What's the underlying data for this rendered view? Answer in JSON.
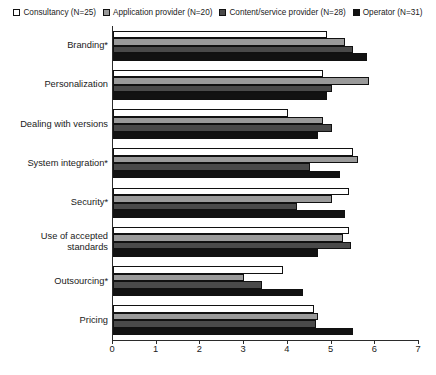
{
  "legend": {
    "entries": [
      {
        "label": "Consultancy (N=25)",
        "color": "#ffffff",
        "swatch": "legend-swatch-consultancy"
      },
      {
        "label": "Application provider (N=20)",
        "color": "#9a9a9a",
        "swatch": "legend-swatch-application-provider"
      },
      {
        "label": "Content/service provider (N=28)",
        "color": "#4a4a4a",
        "swatch": "legend-swatch-content-service-provider"
      },
      {
        "label": "Operator (N=31)",
        "color": "#121212",
        "swatch": "legend-swatch-operator"
      }
    ]
  },
  "axis": {
    "x_ticks": [
      "0",
      "1",
      "2",
      "3",
      "4",
      "5",
      "6",
      "7"
    ]
  },
  "chart_data": {
    "type": "bar",
    "orientation": "horizontal",
    "title": "",
    "subtitle": "",
    "xlabel": "",
    "ylabel": "",
    "xlim": [
      0,
      7
    ],
    "grid": false,
    "legend_position": "top",
    "categories": [
      "Branding*",
      "Personalization",
      "Dealing with versions",
      "System integration*",
      "Security*",
      "Use of accepted standards",
      "Outsourcing*",
      "Pricing"
    ],
    "series": [
      {
        "name": "Consultancy (N=25)",
        "color": "#ffffff",
        "values": [
          4.9,
          4.8,
          4.0,
          5.5,
          5.4,
          5.4,
          3.9,
          4.6
        ]
      },
      {
        "name": "Application provider (N=20)",
        "color": "#9a9a9a",
        "values": [
          5.3,
          5.85,
          4.8,
          5.6,
          5.0,
          5.25,
          3.0,
          4.7
        ]
      },
      {
        "name": "Content/service provider (N=28)",
        "color": "#4a4a4a",
        "values": [
          5.5,
          5.0,
          5.0,
          4.5,
          4.2,
          5.45,
          3.4,
          4.65
        ]
      },
      {
        "name": "Operator (N=31)",
        "color": "#121212",
        "values": [
          5.8,
          4.9,
          4.7,
          5.2,
          5.3,
          4.7,
          4.35,
          5.5
        ]
      }
    ]
  }
}
